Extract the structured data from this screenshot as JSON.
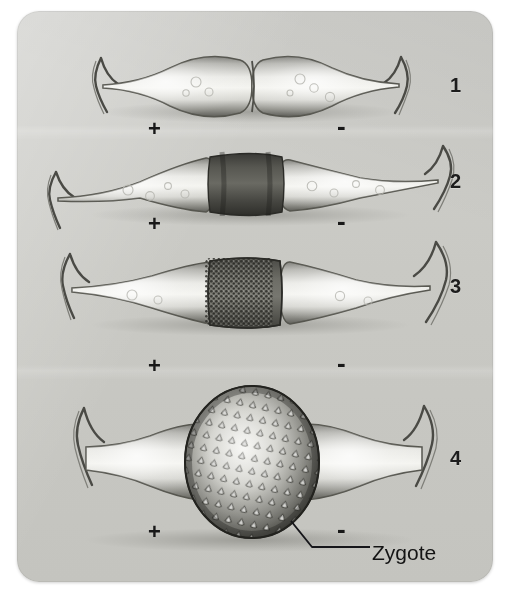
{
  "figure": {
    "background_color": "#ffffff",
    "panel_color": "#c9c9c4",
    "ink_color": "#1d1d1d"
  },
  "stages": [
    {
      "number": "1",
      "caption": "Two compatible filaments/cells come into contact",
      "left_sign": "+",
      "right_sign": "-"
    },
    {
      "number": "2",
      "caption": "A dark conjugation tube forms between the two cells",
      "left_sign": "+",
      "right_sign": "-"
    },
    {
      "number": "3",
      "caption": "Protoplast contents migrate and fuse in the granular tube",
      "left_sign": "+",
      "right_sign": "-"
    },
    {
      "number": "4",
      "caption": "A thick spiny-walled zygote is produced",
      "left_sign": "+",
      "right_sign": "-"
    }
  ],
  "annotations": {
    "zygote_label": "Zygote"
  }
}
